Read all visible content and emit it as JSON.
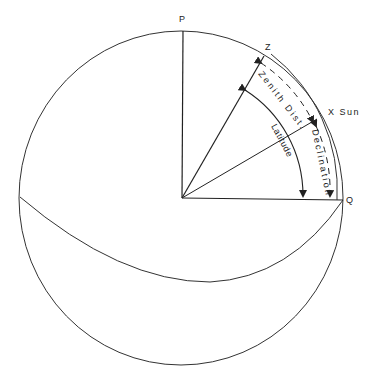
{
  "diagram": {
    "points": {
      "pole": "P",
      "zenith": "Z",
      "sun": "X Sun",
      "equator": "Q"
    },
    "arcs": {
      "zenith_distance": "Zenith Dist.",
      "latitude": "Latitude",
      "declination": "Declination"
    },
    "colors": {
      "line": "#222222",
      "background": "#ffffff"
    }
  }
}
